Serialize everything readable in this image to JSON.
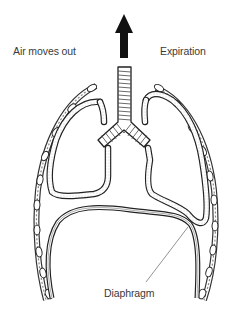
{
  "diagram": {
    "labels": {
      "air_flow": "Air moves out",
      "phase": "Expiration",
      "diaphragm": "Diaphragm"
    },
    "arrow_direction": "up",
    "colors": {
      "ink": "#1a1a1a",
      "label_text": "#3a3a3a",
      "stipple": "#9a9a9a",
      "background": "#ffffff"
    }
  }
}
